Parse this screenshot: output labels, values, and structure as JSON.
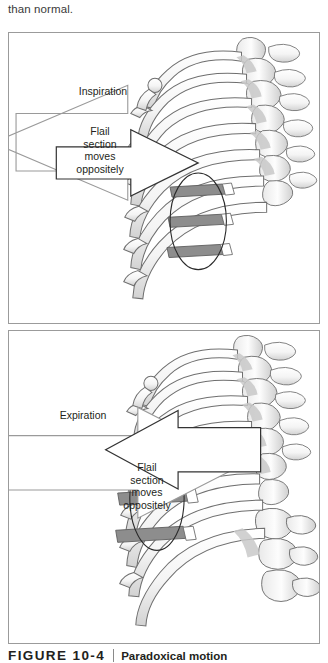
{
  "page": {
    "running_text": "than normal."
  },
  "figure": {
    "caption_label": "FIGURE 10-4",
    "caption_title": "Paradoxical motion",
    "panels": [
      {
        "id": "inspiration",
        "breath_arrow_label": "Inspiration",
        "breath_arrow_direction": "left",
        "flail_arrow_label": "Flail\nsection\nmoves\noppositely",
        "flail_arrow_direction": "right",
        "flail_segment_count": 3,
        "anatomy": "rib cage with flail chest segment, posterior-lateral view"
      },
      {
        "id": "expiration",
        "breath_arrow_label": "Expiration",
        "breath_arrow_direction": "right",
        "flail_arrow_label": "Flail\nsection\nmoves\noppositely",
        "flail_arrow_direction": "left",
        "flail_segment_count": 3,
        "anatomy": "rib cage with flail chest segment, posterior-lateral view"
      }
    ]
  },
  "colors": {
    "panel_border": "#9b9b9b",
    "bone_outline": "#6f6f6f",
    "bone_fill": "#fbfbfb",
    "bone_shade": "#d7d7d7",
    "flail_segment": "#8d8d8d",
    "breath_arrow_stroke": "#9a9a9a",
    "flail_arrow_stroke": "#333333",
    "text": "#231f20"
  }
}
